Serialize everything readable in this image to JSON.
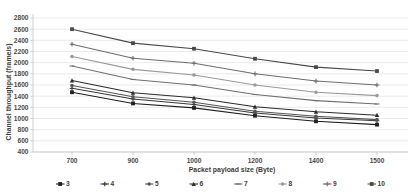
{
  "chart_data": {
    "type": "line",
    "title": "",
    "xlabel": "Packet payload size (Byte)",
    "ylabel": "Channel throughput (frame/s)",
    "x_categories": [
      "700",
      "900",
      "1000",
      "1200",
      "1400",
      "1500"
    ],
    "x_values": [
      700,
      900,
      1000,
      1200,
      1400,
      1500
    ],
    "y_ticks": [
      400,
      600,
      800,
      1000,
      1200,
      1400,
      1600,
      1800,
      2000,
      2200,
      2400,
      2600,
      2800
    ],
    "ylim": [
      400,
      2800
    ],
    "grid": true,
    "legend_position": "bottom",
    "series": [
      {
        "name": "3",
        "values": [
          1470,
          1270,
          1190,
          1050,
          950,
          890
        ],
        "color": "#1f1f1f",
        "marker": "square"
      },
      {
        "name": "4",
        "values": [
          1540,
          1350,
          1250,
          1100,
          1010,
          960
        ],
        "color": "#3a3a3a",
        "marker": "cross"
      },
      {
        "name": "5",
        "values": [
          1590,
          1390,
          1290,
          1130,
          1040,
          980
        ],
        "color": "#565656",
        "marker": "dot"
      },
      {
        "name": "6",
        "values": [
          1680,
          1460,
          1370,
          1210,
          1120,
          1060
        ],
        "color": "#2b2b2b",
        "marker": "triangle"
      },
      {
        "name": "7",
        "values": [
          1940,
          1700,
          1600,
          1430,
          1320,
          1260
        ],
        "color": "#707070",
        "marker": "none"
      },
      {
        "name": "8",
        "values": [
          2110,
          1880,
          1780,
          1600,
          1470,
          1410
        ],
        "color": "#9a9a9a",
        "marker": "dot"
      },
      {
        "name": "9",
        "values": [
          2330,
          2080,
          1990,
          1800,
          1670,
          1600
        ],
        "color": "#6e6e6e",
        "marker": "plus"
      },
      {
        "name": "10",
        "values": [
          2600,
          2350,
          2250,
          2070,
          1920,
          1850
        ],
        "color": "#4a4a4a",
        "marker": "square"
      }
    ]
  },
  "legend": {
    "items": [
      {
        "label": "3"
      },
      {
        "label": "4"
      },
      {
        "label": "5"
      },
      {
        "label": "6"
      },
      {
        "label": "7"
      },
      {
        "label": "8"
      },
      {
        "label": "9"
      },
      {
        "label": "10"
      }
    ]
  }
}
